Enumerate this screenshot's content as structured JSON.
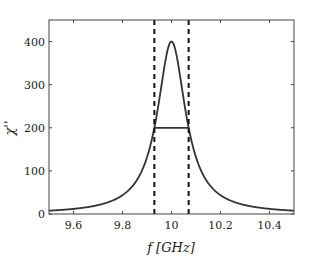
{
  "chart_data": {
    "type": "line",
    "title": "",
    "xlabel": "f [GHz]",
    "ylabel": "χ''",
    "xlim": [
      9.5,
      10.5
    ],
    "ylim": [
      0,
      450
    ],
    "x_ticks": [
      9.6,
      9.8,
      10,
      10.2,
      10.4
    ],
    "x_tick_labels": [
      "9.6",
      "9.8",
      "10",
      "10.2",
      "10.4"
    ],
    "y_ticks": [
      0,
      100,
      200,
      300,
      400
    ],
    "y_tick_labels": [
      "0",
      "100",
      "200",
      "300",
      "400"
    ],
    "grid": false,
    "legend": null,
    "series": [
      {
        "name": "Lorentzian absorption",
        "style": "solid",
        "color": "#333333",
        "peak_x": 10.0,
        "peak_y": 400,
        "half_width": 0.07,
        "x": [
          9.5,
          9.6,
          9.7,
          9.8,
          9.85,
          9.9,
          9.93,
          9.95,
          9.97,
          10.0,
          10.03,
          10.05,
          10.07,
          10.1,
          10.15,
          10.2,
          10.3,
          10.4,
          10.5
        ],
        "y": [
          7.6,
          11.7,
          20.5,
          43.8,
          71.8,
          131.2,
          200,
          264.2,
          337.8,
          400,
          337.8,
          264.2,
          200,
          131.2,
          71.8,
          43.8,
          20.5,
          11.7,
          7.6
        ]
      }
    ],
    "annotations": [
      {
        "type": "vline",
        "x": 9.93,
        "style": "dashed",
        "color": "#111111",
        "label": "lower half-max"
      },
      {
        "type": "vline",
        "x": 10.07,
        "style": "dashed",
        "color": "#111111",
        "label": "upper half-max"
      },
      {
        "type": "hline_segment",
        "x": [
          9.93,
          10.07
        ],
        "y": 200,
        "style": "solid",
        "color": "#333333",
        "label": "FWHM"
      }
    ]
  }
}
